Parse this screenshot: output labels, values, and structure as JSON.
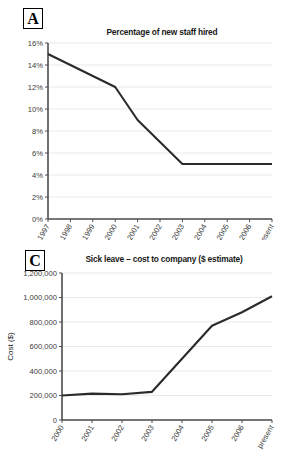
{
  "panels": [
    {
      "letter": "A",
      "title": "Percentage of new staff hired"
    },
    {
      "letter": "C",
      "title": "Sick leave – cost to company ($ estimate)"
    }
  ],
  "chart_data": [
    {
      "type": "line",
      "panel_label": "A",
      "title": "Percentage of new staff hired",
      "xlabel": "",
      "ylabel": "",
      "categories": [
        "1997",
        "1998",
        "1999",
        "2000",
        "2001",
        "2002",
        "2003",
        "2004",
        "2005",
        "2006",
        "present"
      ],
      "values": [
        15,
        14,
        13,
        12,
        9,
        7,
        5,
        5,
        5,
        5,
        5
      ],
      "ytick_labels": [
        "0%",
        "2%",
        "4%",
        "6%",
        "8%",
        "10%",
        "12%",
        "14%",
        "16%"
      ],
      "ytick_values": [
        0,
        2,
        4,
        6,
        8,
        10,
        12,
        14,
        16
      ],
      "ylim": [
        0,
        16
      ],
      "grid": true,
      "legend": "none",
      "line_color": "#2b2b2b"
    },
    {
      "type": "line",
      "panel_label": "C",
      "title": "Sick leave – cost to company ($ estimate)",
      "xlabel": "",
      "ylabel": "Cost ($)",
      "categories": [
        "2000",
        "2001",
        "2002",
        "2003",
        "2004",
        "2005",
        "2006",
        "present"
      ],
      "values": [
        200000,
        215000,
        210000,
        230000,
        500000,
        770000,
        880000,
        1010000
      ],
      "ytick_labels": [
        "0",
        "200,000",
        "400,000",
        "600,000",
        "800,000",
        "1,000,000",
        "1,200,000"
      ],
      "ytick_values": [
        0,
        200000,
        400000,
        600000,
        800000,
        1000000,
        1200000
      ],
      "ylim": [
        0,
        1200000
      ],
      "grid": true,
      "legend": "none",
      "line_color": "#2b2b2b"
    }
  ],
  "colors": {
    "background": "#ffffff",
    "gridline": "#e9e9e9",
    "axis": "#4d4d4d",
    "line": "#2b2b2b",
    "text": "#1a1a1a"
  }
}
